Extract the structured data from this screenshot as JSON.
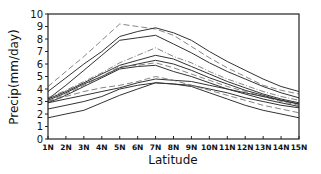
{
  "chart_data": {
    "type": "line",
    "title": "",
    "xlabel": "Latitude",
    "ylabel": "Precip(mm/day)",
    "categories": [
      "1N",
      "2N",
      "3N",
      "4N",
      "5N",
      "6N",
      "7N",
      "8N",
      "9N",
      "10N",
      "11N",
      "12N",
      "13N",
      "14N",
      "15N"
    ],
    "ylim": [
      0,
      10
    ],
    "yticks": [
      0,
      1,
      2,
      3,
      4,
      5,
      6,
      7,
      8,
      9,
      10
    ],
    "grid": false,
    "legend": null,
    "series": [
      {
        "name": "dashed-high",
        "style": "dashed",
        "values": [
          4.2,
          5.4,
          6.6,
          7.9,
          9.2,
          9.0,
          8.8,
          8.3,
          7.4,
          6.5,
          5.7,
          5.0,
          4.3,
          3.9,
          3.6
        ]
      },
      {
        "name": "solid-high-1",
        "style": "solid",
        "values": [
          3.8,
          4.9,
          6.0,
          7.0,
          8.2,
          8.6,
          8.9,
          8.5,
          7.9,
          7.0,
          6.2,
          5.5,
          4.8,
          4.2,
          3.8
        ]
      },
      {
        "name": "solid-high-2",
        "style": "solid",
        "values": [
          3.2,
          4.3,
          5.5,
          6.7,
          7.9,
          8.1,
          8.3,
          7.6,
          6.9,
          6.1,
          5.4,
          4.8,
          4.2,
          3.7,
          3.3
        ]
      },
      {
        "name": "dashdot-1",
        "style": "dashdot",
        "values": [
          3.3,
          3.9,
          4.6,
          5.3,
          6.1,
          6.7,
          7.3,
          6.6,
          6.1,
          5.4,
          4.8,
          4.3,
          3.8,
          3.4,
          3.1
        ]
      },
      {
        "name": "solid-mid-1",
        "style": "solid",
        "values": [
          3.2,
          3.8,
          4.5,
          5.2,
          5.9,
          6.3,
          6.7,
          6.4,
          5.8,
          5.2,
          4.6,
          4.1,
          3.6,
          3.2,
          2.9
        ]
      },
      {
        "name": "solid-mid-2",
        "style": "solid",
        "values": [
          3.1,
          3.7,
          4.4,
          5.0,
          5.7,
          6.0,
          6.3,
          6.0,
          5.5,
          4.9,
          4.4,
          3.9,
          3.5,
          3.1,
          2.8
        ]
      },
      {
        "name": "dashed-mid",
        "style": "dashed",
        "values": [
          3.0,
          3.6,
          4.3,
          5.0,
          5.8,
          5.9,
          6.1,
          5.7,
          5.2,
          4.7,
          4.2,
          3.8,
          3.4,
          3.0,
          2.7
        ]
      },
      {
        "name": "solid-mid-3",
        "style": "solid",
        "values": [
          2.9,
          3.5,
          4.2,
          4.9,
          5.6,
          5.8,
          5.9,
          5.4,
          5.0,
          4.5,
          4.0,
          3.6,
          3.2,
          2.9,
          2.6
        ]
      },
      {
        "name": "solid-low-1",
        "style": "solid",
        "values": [
          2.9,
          3.2,
          3.5,
          3.8,
          4.1,
          4.5,
          4.8,
          4.7,
          4.6,
          4.3,
          4.0,
          3.7,
          3.4,
          3.1,
          2.8
        ]
      },
      {
        "name": "solid-low-2",
        "style": "solid",
        "values": [
          2.4,
          2.7,
          3.0,
          3.4,
          4.0,
          4.3,
          4.5,
          4.4,
          4.3,
          4.0,
          3.7,
          3.3,
          3.0,
          2.7,
          2.5
        ]
      },
      {
        "name": "dashed-low",
        "style": "dashed",
        "values": [
          3.0,
          3.4,
          3.8,
          4.1,
          4.3,
          4.6,
          5.0,
          4.7,
          4.3,
          3.9,
          3.5,
          3.1,
          2.7,
          2.4,
          2.1
        ]
      },
      {
        "name": "solid-lowest",
        "style": "solid",
        "values": [
          1.7,
          2.0,
          2.3,
          2.9,
          3.5,
          4.0,
          4.5,
          4.4,
          4.2,
          3.7,
          3.2,
          2.7,
          2.3,
          2.0,
          1.7
        ]
      }
    ]
  }
}
